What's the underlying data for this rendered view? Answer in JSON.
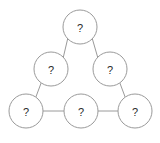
{
  "diagram": {
    "type": "node-link-triangle",
    "background_color": "#ffffff",
    "node_fill_color": "#ffffff",
    "node_stroke_color": "#9a9a9a",
    "edge_stroke_color": "#9a9a9a",
    "label_color": "#2b2b2b",
    "node_radius": 17,
    "node_count": 6,
    "edge_count": 6,
    "nodes": [
      {
        "id": "apex",
        "label": "?",
        "cx": 80,
        "cy": 27,
        "r": 17,
        "row": "top",
        "position": "apex"
      },
      {
        "id": "mid-left",
        "label": "?",
        "cx": 51,
        "cy": 69,
        "r": 17,
        "row": "middle",
        "position": "left"
      },
      {
        "id": "mid-right",
        "label": "?",
        "cx": 110,
        "cy": 69,
        "r": 17,
        "row": "middle",
        "position": "right"
      },
      {
        "id": "bottom-left",
        "label": "?",
        "cx": 26,
        "cy": 111,
        "r": 17,
        "row": "bottom",
        "position": "left"
      },
      {
        "id": "bottom-center",
        "label": "?",
        "cx": 81,
        "cy": 111,
        "r": 17,
        "row": "bottom",
        "position": "center"
      },
      {
        "id": "bottom-right",
        "label": "?",
        "cx": 135,
        "cy": 111,
        "r": 17,
        "row": "bottom",
        "position": "right"
      }
    ],
    "edges": [
      {
        "id": "edge-apex-midleft",
        "from": "apex",
        "to": "mid-left",
        "orientation": "diagonal"
      },
      {
        "id": "edge-apex-midright",
        "from": "apex",
        "to": "mid-right",
        "orientation": "diagonal"
      },
      {
        "id": "edge-midleft-bottomleft",
        "from": "mid-left",
        "to": "bottom-left",
        "orientation": "diagonal"
      },
      {
        "id": "edge-midright-bottomright",
        "from": "mid-right",
        "to": "bottom-right",
        "orientation": "diagonal"
      },
      {
        "id": "edge-bottomleft-center",
        "from": "bottom-left",
        "to": "bottom-center",
        "orientation": "horizontal"
      },
      {
        "id": "edge-center-bottomright",
        "from": "bottom-center",
        "to": "bottom-right",
        "orientation": "horizontal"
      }
    ]
  }
}
